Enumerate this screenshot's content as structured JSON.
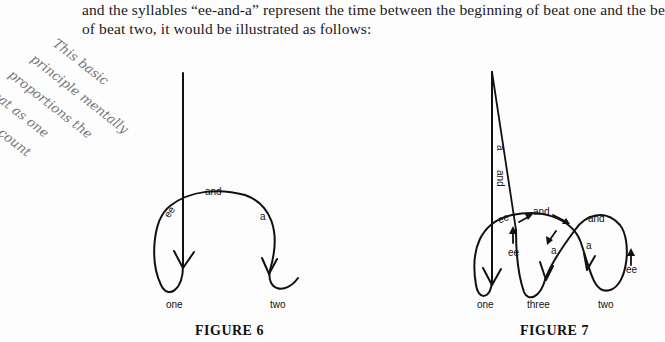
{
  "document": {
    "paragraph_lines": [
      "and the syllables “ee-and-a” represent the time between the beginning of beat one and the be",
      "of beat two, it would be illustrated as follows:"
    ]
  },
  "handwritten_note": {
    "lines": [
      "This basic",
      "principle mentally",
      "proportions the",
      "beat as one",
      "would count",
      "16th notes"
    ]
  },
  "figure6": {
    "caption": "FIGURE 6",
    "labels": {
      "ee": "ee",
      "and": "and",
      "a": "a",
      "one": "one",
      "two": "two"
    }
  },
  "figure7": {
    "caption": "FIGURE 7",
    "labels": {
      "a_top": "a",
      "and_top": "and",
      "ee_left": "ee",
      "and_mid": "and",
      "ee_up_left": "ee",
      "a_mid": "a",
      "a_right": "a",
      "and_right": "and",
      "ee_right": "ee",
      "one": "one",
      "three": "three",
      "two": "two"
    }
  }
}
